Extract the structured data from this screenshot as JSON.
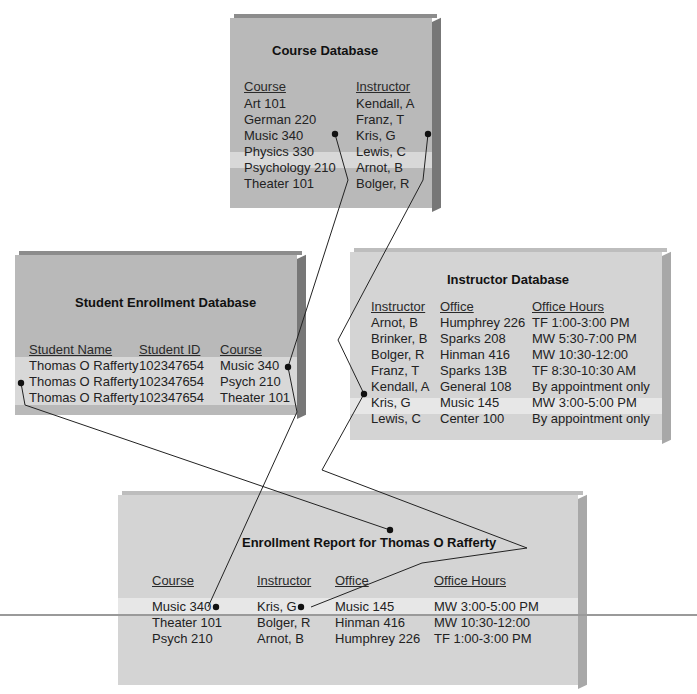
{
  "course_db": {
    "title": "Course Database",
    "headers": [
      "Course",
      "Instructor"
    ],
    "rows": [
      [
        "Art 101",
        "Kendall, A"
      ],
      [
        "German 220",
        "Franz, T"
      ],
      [
        "Music 340",
        "Kris, G"
      ],
      [
        "Physics 330",
        "Lewis, C"
      ],
      [
        "Psychology 210",
        "Arnot, B"
      ],
      [
        "Theater 101",
        "Bolger, R"
      ]
    ],
    "highlighted_row": 2
  },
  "student_db": {
    "title": "Student Enrollment Database",
    "headers": [
      "Student Name",
      "Student ID",
      "Course"
    ],
    "rows": [
      [
        "Thomas O Rafferty",
        "102347654",
        "Music 340"
      ],
      [
        "Thomas O Rafferty",
        "102347654",
        "Psych 210"
      ],
      [
        "Thomas O Rafferty",
        "102347654",
        "Theater 101"
      ]
    ]
  },
  "instructor_db": {
    "title": "Instructor Database",
    "headers": [
      "Instructor",
      "Office",
      "Office Hours"
    ],
    "rows": [
      [
        "Arnot, B",
        "Humphrey 226",
        "TF 1:00-3:00 PM"
      ],
      [
        "Brinker, B",
        "Sparks 208",
        "MW 5:30-7:00 PM"
      ],
      [
        "Bolger, R",
        "Hinman 416",
        "MW 10:30-12:00"
      ],
      [
        "Franz, T",
        "Sparks 13B",
        "TF 8:30-10:30 AM"
      ],
      [
        "Kendall, A",
        "General 108",
        "By appointment only"
      ],
      [
        "Kris, G",
        "Music 145",
        "MW 3:00-5:00 PM"
      ],
      [
        "Lewis, C",
        "Center 100",
        "By appointment only"
      ]
    ],
    "highlighted_row": 5
  },
  "report": {
    "title": "Enrollment Report for Thomas O Rafferty",
    "headers": [
      "Course",
      "Instructor",
      "Office",
      "Office Hours"
    ],
    "rows": [
      [
        "Music 340",
        "Kris, G",
        "Music 145",
        "MW 3:00-5:00 PM"
      ],
      [
        "Theater 101",
        "Bolger, R",
        "Hinman 416",
        "MW 10:30-12:00"
      ],
      [
        "Psych 210",
        "Arnot, B",
        "Humphrey 226",
        "TF 1:00-3:00 PM"
      ]
    ],
    "highlighted_row": 0
  },
  "colors": {
    "box_dark": "#b9b9b9",
    "box_light": "#d4d4d4",
    "connector": "#222222"
  }
}
